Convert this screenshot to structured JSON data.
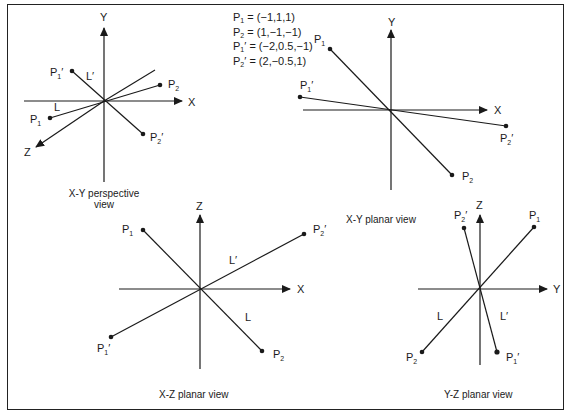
{
  "legend": {
    "entries": [
      {
        "name": "P",
        "sub": "1",
        "prime": "",
        "value": "= (−1,1,1)"
      },
      {
        "name": "P",
        "sub": "2",
        "prime": "",
        "value": "= (1,−1,−1)"
      },
      {
        "name": "P",
        "sub": "1",
        "prime": "′",
        "value": "= (−2,0.5,−1)"
      },
      {
        "name": "P",
        "sub": "2",
        "prime": "′",
        "value": "= (2,−0.5,1)"
      }
    ]
  },
  "views": {
    "xy_perspective": {
      "caption_line1": "X-Y perspective",
      "caption_line2": "view",
      "axes": {
        "y": "Y",
        "x": "X",
        "z": "Z"
      },
      "points": {
        "p1": "P",
        "p2": "P",
        "p1p": "P",
        "p2p": "P"
      },
      "lines": {
        "l": "L",
        "lp": "L′"
      }
    },
    "xy_planar": {
      "caption": "X-Y planar view",
      "axes": {
        "y": "Y",
        "x": "X"
      }
    },
    "xz_planar": {
      "caption": "X-Z planar view",
      "axes": {
        "z": "Z",
        "x": "X"
      },
      "lines": {
        "l": "L",
        "lp": "L′"
      }
    },
    "yz_planar": {
      "caption": "Y-Z planar view",
      "axes": {
        "z": "Z",
        "y": "Y"
      },
      "lines": {
        "l": "L",
        "lp": "L′"
      }
    }
  },
  "point_labels": {
    "p": "P",
    "sub1": "1",
    "sub2": "2",
    "prime": "′"
  },
  "colors": {
    "ink": "#1a1a1a",
    "background": "#ffffff"
  }
}
